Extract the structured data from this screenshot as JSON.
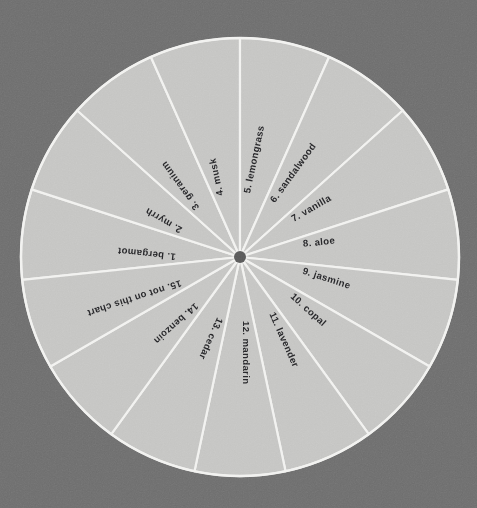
{
  "page": {
    "width": 477,
    "height": 508
  },
  "colors": {
    "background": "#6e6e6e",
    "wheel_fill": "#c5c5c3",
    "spoke": "#f2f2f0",
    "rim": "#f2f2f0",
    "hub": "#5a5a5a",
    "label_text": "#27272a"
  },
  "wheel": {
    "center_x": 240,
    "center_y": 257,
    "radius": 219,
    "hub_radius": 6,
    "segment_count": 15,
    "start_angle_deg": -90,
    "segment_span_deg": 24
  },
  "chart_data": {
    "type": "pie",
    "xlabel": "",
    "ylabel": "",
    "legend_position": "none",
    "grid": false,
    "categories": [
      "1. bergamot",
      "2. myrrh",
      "3. geranium",
      "4. musk",
      "5. lemongrass",
      "6. sandalwood",
      "7. vanilla",
      "8. aloe",
      "9. jasmine",
      "10. copal",
      "11. lavender",
      "12. mandarin",
      "13. cedar",
      "14. benzoin",
      "15. not on this chart"
    ],
    "values": [
      24,
      24,
      24,
      24,
      24,
      24,
      24,
      24,
      24,
      24,
      24,
      24,
      24,
      24,
      24
    ],
    "value_unit": "degrees",
    "slice_count": 15,
    "equal_slices": true
  },
  "segments": [
    {
      "index": 1,
      "number": "1.",
      "name": "bergamot",
      "label": "1.  bergamot",
      "mid_angle_deg": 186,
      "label_radius": 150
    },
    {
      "index": 2,
      "number": "2.",
      "name": "myrrh",
      "label": "2.  myrrh",
      "mid_angle_deg": 210,
      "label_radius": 150
    },
    {
      "index": 3,
      "number": "3.",
      "name": "geranium",
      "label": "3.  geranium",
      "mid_angle_deg": 234,
      "label_radius": 150
    },
    {
      "index": 4,
      "number": "4.",
      "name": "musk",
      "label": "4.  musk",
      "mid_angle_deg": 258,
      "label_radius": 150
    },
    {
      "index": 5,
      "number": "5.",
      "name": "lemongrass",
      "label": "5.  lemongrass",
      "mid_angle_deg": 282,
      "label_radius": 150
    },
    {
      "index": 6,
      "number": "6.",
      "name": "sandalwood",
      "label": "6.  sandalwood",
      "mid_angle_deg": 306,
      "label_radius": 150
    },
    {
      "index": 7,
      "number": "7.",
      "name": "vanilla",
      "label": "7.  vanilla",
      "mid_angle_deg": 330,
      "label_radius": 150
    },
    {
      "index": 8,
      "number": "8.",
      "name": "aloe",
      "label": "8.  aloe",
      "mid_angle_deg": 354,
      "label_radius": 150
    },
    {
      "index": 9,
      "number": "9.",
      "name": "jasmine",
      "label": "9.  jasmine",
      "mid_angle_deg": 18,
      "label_radius": 150
    },
    {
      "index": 10,
      "number": "10.",
      "name": "copal",
      "label": "10.  copal",
      "mid_angle_deg": 42,
      "label_radius": 150
    },
    {
      "index": 11,
      "number": "11.",
      "name": "lavender",
      "label": "11.  lavender",
      "mid_angle_deg": 66,
      "label_radius": 150
    },
    {
      "index": 12,
      "number": "12.",
      "name": "mandarin",
      "label": "12.  mandarin",
      "mid_angle_deg": 90,
      "label_radius": 150
    },
    {
      "index": 13,
      "number": "13.",
      "name": "cedar",
      "label": "13.  cedar",
      "mid_angle_deg": 114,
      "label_radius": 150
    },
    {
      "index": 14,
      "number": "14.",
      "name": "benzoin",
      "label": "14.  benzoin",
      "mid_angle_deg": 138,
      "label_radius": 150
    },
    {
      "index": 15,
      "number": "15.",
      "name": "not on this chart",
      "label": "15.  not on this chart",
      "mid_angle_deg": 162,
      "label_radius": 150
    }
  ]
}
